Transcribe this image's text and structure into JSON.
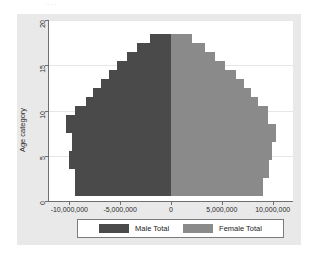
{
  "artifact_text": "····",
  "colors": {
    "male": "#4a4a4a",
    "female": "#8a8a8a",
    "graph_background": "#e9e9e9",
    "plot_background": "#ffffff",
    "axis": "#6f6f6f",
    "gridline": "#e6e6e6"
  },
  "legend": {
    "position": "bottom-center",
    "items": [
      {
        "label": "Male Total",
        "color": "#4a4a4a",
        "name": "male-total"
      },
      {
        "label": "Female Total",
        "color": "#8a8a8a",
        "name": "female-total"
      }
    ]
  },
  "chart_data": {
    "type": "bar",
    "subtype": "population-pyramid",
    "orientation": "horizontal",
    "title": "",
    "xlabel": "",
    "ylabel": "Age category",
    "xlim": [
      -12000000,
      12000000
    ],
    "ylim": [
      0,
      20
    ],
    "grid": true,
    "xticks": [
      -10000000,
      -5000000,
      0,
      5000000,
      10000000
    ],
    "xtick_labels": [
      "-10,000,000",
      "-5,000,000",
      "0",
      "5,000,000",
      "10,000,000"
    ],
    "yticks": [
      0,
      5,
      10,
      15,
      20
    ],
    "ytick_labels": [
      "0",
      "5",
      "10",
      "15",
      "20"
    ],
    "categories": [
      1,
      2,
      3,
      4,
      5,
      6,
      7,
      8,
      9,
      10,
      11,
      12,
      13,
      14,
      15,
      16,
      17,
      18
    ],
    "series": [
      {
        "name": "Male Total",
        "color": "#4a4a4a",
        "sign": "negative",
        "values": [
          9400000,
          9400000,
          9400000,
          10000000,
          10000000,
          9700000,
          9700000,
          10300000,
          10300000,
          9400000,
          8400000,
          7700000,
          6900000,
          6100000,
          5300000,
          4300000,
          3300000,
          2100000
        ]
      },
      {
        "name": "Female Total",
        "color": "#8a8a8a",
        "sign": "positive",
        "values": [
          9000000,
          9000000,
          9600000,
          9600000,
          9900000,
          9900000,
          10300000,
          10300000,
          9500000,
          9500000,
          8600000,
          7900000,
          7200000,
          6400000,
          5300000,
          4300000,
          3300000,
          2100000
        ]
      }
    ]
  }
}
